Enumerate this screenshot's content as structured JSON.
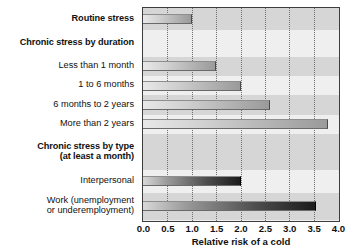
{
  "chart_data": {
    "type": "bar",
    "orientation": "horizontal",
    "title": "",
    "xlabel": "Relative risk of a cold",
    "ylabel": "",
    "xlim": [
      0.0,
      4.0
    ],
    "xticks": [
      "0.0",
      "0.5",
      "1.0",
      "1.5",
      "2.0",
      "2.5",
      "3.0",
      "3.5",
      "4.0"
    ],
    "grid": "vertical-dotted",
    "legend": "none",
    "rows": [
      {
        "label": "Routine stress",
        "type": "bar",
        "value": 1.0,
        "style": "light",
        "bold": true
      },
      {
        "label": "Chronic stress by duration",
        "type": "header",
        "value": null,
        "style": "none",
        "bold": true
      },
      {
        "label": "Less than 1 month",
        "type": "bar",
        "value": 1.5,
        "style": "light",
        "bold": false
      },
      {
        "label": "1 to 6 months",
        "type": "bar",
        "value": 2.0,
        "style": "light",
        "bold": false
      },
      {
        "label": "6 months to 2 years",
        "type": "bar",
        "value": 2.6,
        "style": "light",
        "bold": false
      },
      {
        "label": "More than 2 years",
        "type": "bar",
        "value": 3.8,
        "style": "light",
        "bold": false
      },
      {
        "label": "Chronic stress by type\n(at least a month)",
        "type": "header",
        "value": null,
        "style": "none",
        "bold": true
      },
      {
        "label": "Interpersonal",
        "type": "bar",
        "value": 2.0,
        "style": "dark",
        "bold": false
      },
      {
        "label": "Work (unemployment\nor underemployment)",
        "type": "bar",
        "value": 3.55,
        "style": "dark",
        "bold": false
      }
    ],
    "categories": [
      "Routine stress",
      "Less than 1 month",
      "1 to 6 months",
      "6 months to 2 years",
      "More than 2 years",
      "Interpersonal",
      "Work (unemployment or underemployment)"
    ],
    "values": [
      1.0,
      1.5,
      2.0,
      2.6,
      3.8,
      2.0,
      3.55
    ],
    "colors": {
      "plot_background": "#efefef",
      "band_shade": "#d6d6d6",
      "axis_line": "#3d3d3d",
      "gridline": "#6f6f6f",
      "bar_light": "#b4b4b4",
      "bar_dark": "#1c1c1c",
      "text": "#111111"
    }
  }
}
